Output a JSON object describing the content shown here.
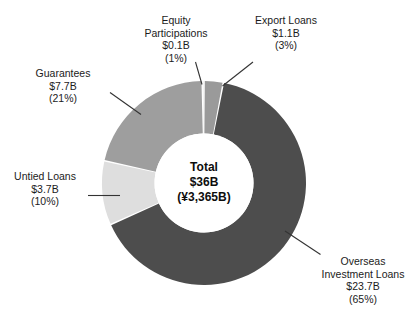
{
  "chart_data": {
    "type": "pie",
    "variant": "donut",
    "title": "",
    "subtitle": "",
    "xlabel": "",
    "ylabel": "",
    "legend_position": "none",
    "grid": false,
    "total": {
      "title_label": "Total",
      "usd": "$36B",
      "jpy": "(¥3,365B)"
    },
    "units": "USD billions",
    "categories": [
      "Overseas Investment Loans",
      "Guarantees",
      "Untied Loans",
      "Export Loans",
      "Equity Participations"
    ],
    "values": [
      23.7,
      7.7,
      3.7,
      1.1,
      0.1
    ],
    "percents": [
      65,
      21,
      10,
      3,
      1
    ],
    "slices": [
      {
        "name": "Overseas Investment Loans",
        "name_lines": [
          "Overseas",
          "Investment Loans"
        ],
        "amount": "$23.7B",
        "percent_label": "(65%)",
        "value": 23.7,
        "percent": 65,
        "color": "#4d4d4d"
      },
      {
        "name": "Guarantees",
        "name_lines": [
          "Guarantees"
        ],
        "amount": "$7.7B",
        "percent_label": "(21%)",
        "value": 7.7,
        "percent": 21,
        "color": "#9e9e9e"
      },
      {
        "name": "Untied Loans",
        "name_lines": [
          "Untied Loans"
        ],
        "amount": "$3.7B",
        "percent_label": "(10%)",
        "value": 3.7,
        "percent": 10,
        "color": "#dedede"
      },
      {
        "name": "Export Loans",
        "name_lines": [
          "Export Loans"
        ],
        "amount": "$1.1B",
        "percent_label": "(3%)",
        "value": 1.1,
        "percent": 3,
        "color": "#9a9a9a"
      },
      {
        "name": "Equity Participations",
        "name_lines": [
          "Equity",
          "Participations"
        ],
        "amount": "$0.1B",
        "percent_label": "(1%)",
        "value": 0.1,
        "percent": 1,
        "color": "#efefef"
      }
    ],
    "colors": {
      "overseas_investment_loans": "#4d4d4d",
      "guarantees": "#9e9e9e",
      "untied_loans": "#dedede",
      "export_loans": "#9a9a9a",
      "equity_participations": "#efefef",
      "leader_line": "#333333",
      "background": "#ffffff",
      "text": "#1b1b1b"
    }
  },
  "labels": {
    "equity": {
      "l1": "Equity",
      "l2": "Participations",
      "l3": "$0.1B",
      "l4": "(1%)"
    },
    "export": {
      "l1": "Export Loans",
      "l2": "$1.1B",
      "l3": "(3%)"
    },
    "guarantees": {
      "l1": "Guarantees",
      "l2": "$7.7B",
      "l3": "(21%)"
    },
    "untied": {
      "l1": "Untied Loans",
      "l2": "$3.7B",
      "l3": "(10%)"
    },
    "overseas": {
      "l1": "Overseas",
      "l2": "Investment Loans",
      "l3": "$23.7B",
      "l4": "(65%)"
    },
    "center": {
      "l1": "Total",
      "l2": "$36B",
      "l3": "(¥3,365B)"
    }
  }
}
